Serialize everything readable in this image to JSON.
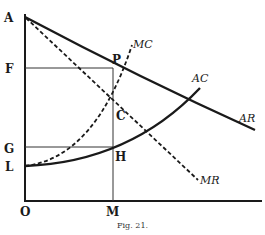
{
  "figure": {
    "caption": "Fig. 21.",
    "axis_labels": {
      "origin": "O",
      "y_points": [
        "A",
        "F",
        "G",
        "L"
      ],
      "x_points": [
        "M"
      ]
    },
    "point_labels": {
      "A": "A",
      "F": "F",
      "G": "G",
      "L": "L",
      "O": "O",
      "M": "M",
      "P": "P",
      "C": "C",
      "H": "H"
    },
    "curves": {
      "AR": {
        "label": "AR",
        "style": "solid-thick"
      },
      "AC": {
        "label": "AC",
        "style": "solid-thick"
      },
      "MC": {
        "label": "MC",
        "style": "dashed"
      },
      "MR": {
        "label": "MR",
        "style": "dashed"
      }
    },
    "colors": {
      "ink": "#1a1a1a",
      "background": "#ffffff"
    }
  }
}
